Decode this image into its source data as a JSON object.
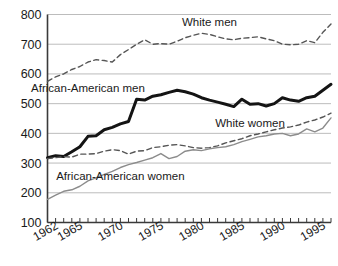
{
  "chart_data": {
    "type": "line",
    "title": "",
    "subtitle": "",
    "xlabel": "",
    "ylabel": "",
    "xlim": [
      1962,
      1997
    ],
    "ylim": [
      100,
      800
    ],
    "yticks": [
      100,
      200,
      300,
      400,
      500,
      600,
      700,
      800
    ],
    "ytick_labels": [
      "100",
      "200",
      "300",
      "400",
      "500",
      "600",
      "700",
      "800"
    ],
    "xticks": [
      1962,
      1963,
      1964,
      1965,
      1966,
      1967,
      1968,
      1969,
      1970,
      1971,
      1972,
      1973,
      1974,
      1975,
      1976,
      1977,
      1978,
      1979,
      1980,
      1981,
      1982,
      1983,
      1984,
      1985,
      1986,
      1987,
      1988,
      1989,
      1990,
      1991,
      1992,
      1993,
      1994,
      1995,
      1996,
      1997
    ],
    "xtick_labels": [
      "1962",
      "1965",
      "1970",
      "1975",
      "1980",
      "1985",
      "1990",
      "1995"
    ],
    "xtick_label_years": [
      1962,
      1965,
      1970,
      1975,
      1980,
      1985,
      1990,
      1995
    ],
    "grid": true,
    "grid_axis": "y",
    "legend_position": "inline-annotations",
    "x": [
      1962,
      1963,
      1964,
      1965,
      1966,
      1967,
      1968,
      1969,
      1970,
      1971,
      1972,
      1973,
      1974,
      1975,
      1976,
      1977,
      1978,
      1979,
      1980,
      1981,
      1982,
      1983,
      1984,
      1985,
      1986,
      1987,
      1988,
      1989,
      1990,
      1991,
      1992,
      1993,
      1994,
      1995,
      1996,
      1997
    ],
    "series": [
      {
        "name": "White men",
        "style": "dashed",
        "color": "#555555",
        "width": 1.4,
        "label_x": 1982,
        "label_y": 775,
        "values": [
          575,
          590,
          600,
          615,
          625,
          640,
          648,
          645,
          640,
          665,
          682,
          700,
          715,
          700,
          702,
          700,
          710,
          722,
          730,
          737,
          733,
          725,
          718,
          715,
          720,
          722,
          725,
          718,
          712,
          700,
          698,
          700,
          712,
          705,
          740,
          768
        ]
      },
      {
        "name": "African-American men",
        "style": "solid-bold",
        "color": "#141414",
        "width": 3.0,
        "label_x": 1967,
        "label_y": 552,
        "values": [
          318,
          325,
          322,
          338,
          355,
          390,
          392,
          412,
          420,
          432,
          440,
          515,
          512,
          525,
          530,
          538,
          545,
          540,
          532,
          520,
          512,
          505,
          498,
          490,
          515,
          498,
          500,
          492,
          500,
          520,
          512,
          508,
          520,
          525,
          545,
          565
        ]
      },
      {
        "name": "White women",
        "style": "dashed",
        "color": "#555555",
        "width": 1.4,
        "label_x": 1987,
        "label_y": 435,
        "values": [
          315,
          318,
          322,
          320,
          330,
          330,
          332,
          340,
          345,
          342,
          330,
          340,
          342,
          352,
          355,
          360,
          362,
          358,
          352,
          350,
          352,
          358,
          368,
          375,
          382,
          392,
          398,
          405,
          412,
          418,
          422,
          428,
          438,
          445,
          455,
          468
        ]
      },
      {
        "name": "African-American women",
        "style": "solid-thin",
        "color": "#8c8c8c",
        "width": 1.4,
        "label_x": 1971,
        "label_y": 258,
        "values": [
          178,
          192,
          205,
          210,
          222,
          240,
          250,
          262,
          272,
          285,
          295,
          302,
          310,
          318,
          332,
          315,
          322,
          340,
          345,
          342,
          348,
          352,
          355,
          362,
          372,
          380,
          388,
          392,
          398,
          400,
          392,
          398,
          415,
          405,
          418,
          452
        ]
      }
    ]
  },
  "annotations": [
    {
      "id": "white-men-label",
      "text": "White men"
    },
    {
      "id": "african-american-men-label",
      "text": "African-American men"
    },
    {
      "id": "white-women-label",
      "text": "White women"
    },
    {
      "id": "african-american-women-label",
      "text": "African-American women"
    }
  ],
  "axis": {
    "y_labels": [
      "800",
      "700",
      "600",
      "500",
      "400",
      "300",
      "200",
      "100"
    ],
    "x_labels": [
      "1962",
      "1965",
      "1970",
      "1975",
      "1980",
      "1985",
      "1990",
      "1995"
    ]
  },
  "colors": {
    "axis": "#3a3a3a",
    "grid": "#b4b4b4",
    "bold_series": "#141414",
    "dashed_series": "#555555",
    "thin_series": "#8c8c8c",
    "background": "#ffffff",
    "text": "#1a1a1a"
  }
}
